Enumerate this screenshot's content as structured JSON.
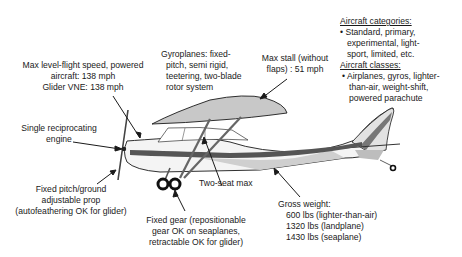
{
  "diagram": {
    "labels": {
      "max_speed": [
        "Max level-flight speed, powered",
        "aircraft: 138 mph",
        "Glider VNE: 138 mph"
      ],
      "gyroplanes": [
        "Gyroplanes: fixed-",
        "pitch, semi rigid,",
        "teetering, two-blade",
        "rotor system"
      ],
      "max_stall": [
        "Max stall (without",
        "flaps) : 51 mph"
      ],
      "engine": [
        "Single reciprocating",
        "engine"
      ],
      "prop": [
        "Fixed pitch/ground",
        "adjustable prop",
        "(autofeathering OK for glider)"
      ],
      "seats": "Two-seat max",
      "gear": [
        "Fixed gear (repositionable",
        "gear OK on seaplanes,",
        "retractable OK for glider)"
      ],
      "gross_weight": {
        "title": "Gross weight:",
        "items": [
          "600 lbs (lighter-than-air)",
          "1320 lbs (landplane)",
          "1430 lbs (seaplane)"
        ]
      }
    },
    "legend": {
      "categories_title": "Aircraft categories:",
      "categories_lines": [
        "• Standard, primary,",
        "experimental, light-",
        "sport, limited, etc."
      ],
      "classes_title": "Aircraft classes:",
      "classes_lines": [
        "• Airplanes, gyros, lighter-",
        "than-air, weight-shift,",
        "powered parachute"
      ]
    },
    "colors": {
      "outline": "#1a1a1a",
      "wing_fill": "#c8c8c8",
      "fuselage_fill": "#f4f4f4",
      "stripe": "#555555",
      "shadow": "#bdbdbd"
    }
  }
}
